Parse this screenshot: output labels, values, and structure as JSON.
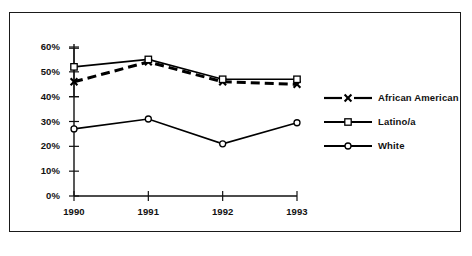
{
  "chart_data": {
    "type": "line",
    "title": "",
    "subtitle": "",
    "xlabel": "",
    "ylabel": "",
    "categories": [
      "1990",
      "1991",
      "1992",
      "1993"
    ],
    "x_tick_labels": [
      "1990",
      "1991",
      "1992",
      "1993"
    ],
    "y_tick_labels": [
      "0%",
      "10%",
      "20%",
      "30%",
      "40%",
      "50%",
      "60%"
    ],
    "y_tick_values": [
      0,
      10,
      20,
      30,
      40,
      50,
      60
    ],
    "ylim": [
      0,
      60
    ],
    "xlim": [
      1990,
      1993
    ],
    "grid": false,
    "legend_position": "right",
    "series": [
      {
        "name": "African American",
        "values": [
          46,
          54,
          46,
          45
        ],
        "marker": "x",
        "line_style": "dashed",
        "color": "#000000"
      },
      {
        "name": "Latino/a",
        "values": [
          52,
          55,
          47,
          47
        ],
        "marker": "square",
        "line_style": "solid",
        "color": "#000000"
      },
      {
        "name": "White",
        "values": [
          27,
          31,
          21,
          29.5
        ],
        "marker": "circle",
        "line_style": "solid",
        "color": "#000000"
      }
    ],
    "error_bars": [
      {
        "series": "Latino/a",
        "category": "1990",
        "upper": 59.5,
        "lower": 40
      }
    ]
  },
  "legend": {
    "items": [
      {
        "label": "African American",
        "marker": "x",
        "line_style": "dashed"
      },
      {
        "label": "Latino/a",
        "marker": "square",
        "line_style": "solid"
      },
      {
        "label": "White",
        "marker": "circle",
        "line_style": "solid"
      }
    ]
  },
  "axes": {
    "y_labels": [
      "60%",
      "50%",
      "40%",
      "30%",
      "20%",
      "10%",
      "0%"
    ],
    "x_labels": [
      "1990",
      "1991",
      "1992",
      "1993"
    ]
  },
  "colors": {
    "ink": "#000000",
    "frame": "#1a1a1a",
    "background": "#ffffff"
  }
}
